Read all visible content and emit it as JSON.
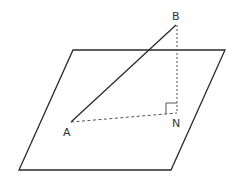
{
  "diagram": {
    "colors": {
      "stroke": "#2a2a2a",
      "dashed": "#555555",
      "label": "#333333",
      "background": "#ffffff"
    },
    "plane": {
      "shape": "parallelogram",
      "vertices": [
        [
          73,
          50
        ],
        [
          225,
          50
        ],
        [
          171,
          170
        ],
        [
          19,
          170
        ]
      ]
    },
    "points": {
      "A": {
        "label": "A",
        "x": 71,
        "y": 122,
        "label_x": 63,
        "label_y": 136
      },
      "B": {
        "label": "B",
        "x": 176,
        "y": 25,
        "label_x": 172,
        "label_y": 20
      },
      "N": {
        "label": "N",
        "x": 177,
        "y": 113,
        "label_x": 172,
        "label_y": 126
      }
    },
    "segments": [
      {
        "from": "A",
        "to": "B",
        "style": "solid"
      },
      {
        "from": "B",
        "to": "N",
        "style": "dashed"
      },
      {
        "from": "A",
        "to": "N",
        "style": "dashed"
      }
    ],
    "right_angle_marker": {
      "at": "N",
      "size": 10
    }
  }
}
